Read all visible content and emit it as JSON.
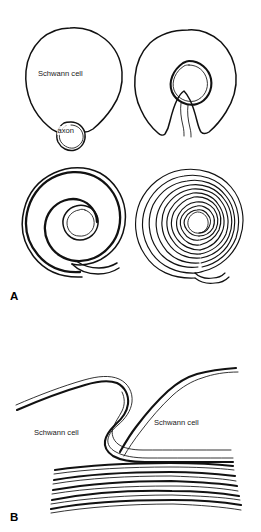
{
  "figure": {
    "background_color": "#ffffff",
    "ink_color": "#111111"
  },
  "panel_a": {
    "letter": "A",
    "caption": "Stages of myelin wrapping by a Schwann cell",
    "stages": [
      {
        "index": 1,
        "name": "axon-engulfment-start",
        "labels": {
          "cell": "Schwann cell",
          "axon": "axon"
        }
      },
      {
        "index": 2,
        "name": "axon-enclosed",
        "labels": {}
      },
      {
        "index": 3,
        "name": "early-spiral-wrapping",
        "wrap_count": 3,
        "labels": {}
      },
      {
        "index": 4,
        "name": "compact-myelin-many-wraps",
        "wrap_count": 11,
        "labels": {}
      }
    ]
  },
  "panel_b": {
    "letter": "B",
    "caption": "Node region between two adjacent Schwann cells",
    "labels": {
      "cell_left": "Schwann cell",
      "cell_right": "Schwann cell"
    },
    "myelin_layer_count": 7
  }
}
